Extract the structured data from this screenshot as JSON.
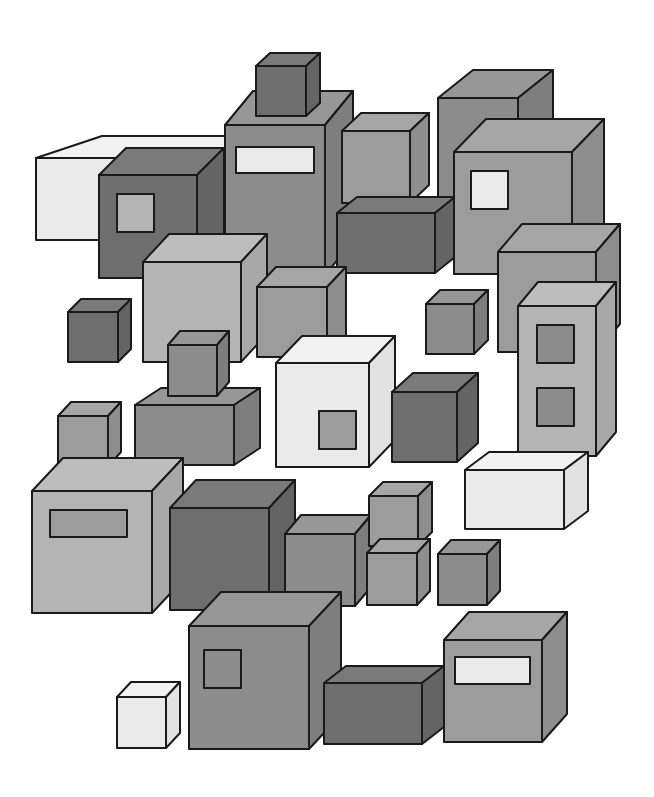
{
  "illustration": {
    "title": "Grayscale isometric boxes",
    "background": "#ffffff",
    "outline": "#1a1a1a",
    "palette": {
      "white": {
        "front": "#eaeaea",
        "top": "#f2f2f2",
        "side": "#e2e2e2"
      },
      "light": {
        "front": "#b4b4b4",
        "top": "#bdbdbd",
        "side": "#a8a8a8"
      },
      "mid": {
        "front": "#9c9c9c",
        "top": "#a6a6a6",
        "side": "#8e8e8e"
      },
      "gray": {
        "front": "#8c8c8c",
        "top": "#979797",
        "side": "#7e7e7e"
      },
      "dark": {
        "front": "#6e6e6e",
        "top": "#7a7a7a",
        "side": "#646464"
      }
    },
    "boxes": [
      {
        "name": "box-back-tall-right",
        "x": 438,
        "y": 98,
        "w": 80,
        "h": 120,
        "dx": 35,
        "dy": -28,
        "tone": "gray"
      },
      {
        "name": "box-back-white-wide",
        "x": 36,
        "y": 158,
        "w": 190,
        "h": 82,
        "dx": 66,
        "dy": -22,
        "tone": "white"
      },
      {
        "name": "box-tower",
        "x": 225,
        "y": 125,
        "w": 100,
        "h": 150,
        "dx": 28,
        "dy": -34,
        "tone": "gray",
        "window": {
          "x": 11,
          "y": 22,
          "w": 78,
          "h": 26,
          "tone": "white"
        }
      },
      {
        "name": "box-tower-top-cube",
        "x": 256,
        "y": 66,
        "w": 50,
        "h": 50,
        "dx": 14,
        "dy": -13,
        "tone": "dark"
      },
      {
        "name": "box-dark-window-left",
        "x": 99,
        "y": 175,
        "w": 98,
        "h": 103,
        "dx": 27,
        "dy": -27,
        "tone": "dark",
        "window": {
          "x": 18,
          "y": 19,
          "w": 37,
          "h": 38,
          "tone": "light"
        }
      },
      {
        "name": "box-small-upper-mid",
        "x": 342,
        "y": 131,
        "w": 68,
        "h": 72,
        "dx": 19,
        "dy": -18,
        "tone": "mid"
      },
      {
        "name": "box-dark-flat-mid",
        "x": 337,
        "y": 213,
        "w": 98,
        "h": 60,
        "dx": 20,
        "dy": -16,
        "tone": "dark"
      },
      {
        "name": "box-right-window-white",
        "x": 454,
        "y": 152,
        "w": 118,
        "h": 122,
        "dx": 32,
        "dy": -33,
        "tone": "mid",
        "window": {
          "x": 17,
          "y": 19,
          "w": 37,
          "h": 38,
          "tone": "white"
        }
      },
      {
        "name": "box-light-center",
        "x": 143,
        "y": 262,
        "w": 98,
        "h": 100,
        "dx": 26,
        "dy": -28,
        "tone": "light"
      },
      {
        "name": "box-mid-center",
        "x": 257,
        "y": 287,
        "w": 70,
        "h": 70,
        "dx": 19,
        "dy": -20,
        "tone": "mid"
      },
      {
        "name": "box-right-wide",
        "x": 498,
        "y": 252,
        "w": 98,
        "h": 100,
        "dx": 24,
        "dy": -28,
        "tone": "mid"
      },
      {
        "name": "box-small-dark-left",
        "x": 68,
        "y": 312,
        "w": 50,
        "h": 50,
        "dx": 13,
        "dy": -13,
        "tone": "dark"
      },
      {
        "name": "box-small-right-mid",
        "x": 426,
        "y": 304,
        "w": 48,
        "h": 50,
        "dx": 14,
        "dy": -14,
        "tone": "gray"
      },
      {
        "name": "box-tall-twin-windows",
        "x": 518,
        "y": 306,
        "w": 78,
        "h": 150,
        "dx": 20,
        "dy": -24,
        "tone": "light",
        "window": {
          "x": 19,
          "y": 19,
          "w": 37,
          "h": 38,
          "tone": "gray"
        },
        "window2": {
          "x": 19,
          "y": 82,
          "w": 37,
          "h": 38,
          "tone": "gray"
        }
      },
      {
        "name": "box-wide-flat-left",
        "x": 135,
        "y": 405,
        "w": 99,
        "h": 60,
        "dx": 26,
        "dy": -17,
        "tone": "gray"
      },
      {
        "name": "box-stacked-small-top",
        "x": 168,
        "y": 345,
        "w": 49,
        "h": 51,
        "dx": 12,
        "dy": -14,
        "tone": "gray"
      },
      {
        "name": "box-small-left-mid",
        "x": 58,
        "y": 416,
        "w": 50,
        "h": 50,
        "dx": 13,
        "dy": -14,
        "tone": "mid"
      },
      {
        "name": "box-white-center",
        "x": 276,
        "y": 363,
        "w": 93,
        "h": 104,
        "dx": 26,
        "dy": -27,
        "tone": "white",
        "window": {
          "x": 43,
          "y": 48,
          "w": 37,
          "h": 38,
          "tone": "mid"
        }
      },
      {
        "name": "box-dark-right-center",
        "x": 392,
        "y": 392,
        "w": 65,
        "h": 70,
        "dx": 21,
        "dy": -19,
        "tone": "dark"
      },
      {
        "name": "box-white-flat-right",
        "x": 465,
        "y": 470,
        "w": 99,
        "h": 59,
        "dx": 24,
        "dy": -18,
        "tone": "white"
      },
      {
        "name": "box-large-left-window",
        "x": 32,
        "y": 491,
        "w": 120,
        "h": 122,
        "dx": 31,
        "dy": -33,
        "tone": "light",
        "window": {
          "x": 18,
          "y": 19,
          "w": 77,
          "h": 27,
          "tone": "mid"
        }
      },
      {
        "name": "box-large-dark",
        "x": 170,
        "y": 508,
        "w": 99,
        "h": 102,
        "dx": 26,
        "dy": -28,
        "tone": "dark"
      },
      {
        "name": "box-mid-cube-row",
        "x": 285,
        "y": 534,
        "w": 70,
        "h": 72,
        "dx": 16,
        "dy": -19,
        "tone": "gray"
      },
      {
        "name": "box-small-top-stack",
        "x": 369,
        "y": 496,
        "w": 49,
        "h": 50,
        "dx": 14,
        "dy": -14,
        "tone": "mid"
      },
      {
        "name": "box-small-bottom-stack",
        "x": 367,
        "y": 553,
        "w": 50,
        "h": 52,
        "dx": 13,
        "dy": -14,
        "tone": "mid"
      },
      {
        "name": "box-small-right-row",
        "x": 438,
        "y": 554,
        "w": 49,
        "h": 51,
        "dx": 13,
        "dy": -14,
        "tone": "gray"
      },
      {
        "name": "box-large-bottom-window",
        "x": 189,
        "y": 626,
        "w": 120,
        "h": 123,
        "dx": 32,
        "dy": -34,
        "tone": "gray",
        "window": {
          "x": 15,
          "y": 24,
          "w": 37,
          "h": 38,
          "tone": "gray"
        }
      },
      {
        "name": "box-small-white-bottom",
        "x": 117,
        "y": 697,
        "w": 49,
        "h": 51,
        "dx": 14,
        "dy": -15,
        "tone": "white"
      },
      {
        "name": "box-dark-flat-bottom",
        "x": 324,
        "y": 683,
        "w": 98,
        "h": 61,
        "dx": 22,
        "dy": -17,
        "tone": "dark"
      },
      {
        "name": "box-bottom-right-window",
        "x": 444,
        "y": 640,
        "w": 98,
        "h": 102,
        "dx": 25,
        "dy": -28,
        "tone": "mid",
        "window": {
          "x": 11,
          "y": 17,
          "w": 75,
          "h": 27,
          "tone": "white"
        }
      }
    ]
  }
}
